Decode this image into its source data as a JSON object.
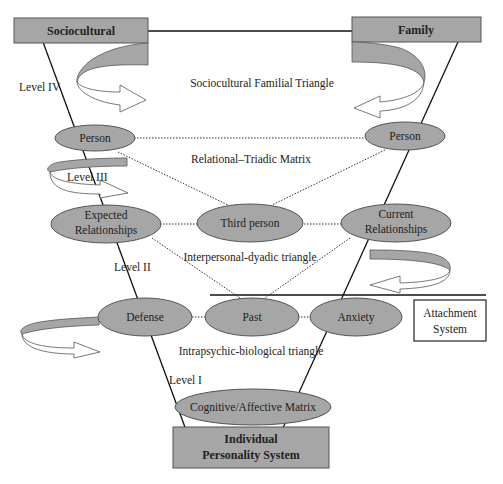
{
  "diagram": {
    "top_boxes": {
      "left": "Sociocultural",
      "right": "Family"
    },
    "bottom_box": {
      "line1": "Individual",
      "line2": "Personality System"
    },
    "side_box": {
      "line1": "Attachment",
      "line2": "System"
    },
    "levels": {
      "level4": "Level IV",
      "level3": "Level III",
      "level2": "Level II",
      "level1": "Level I"
    },
    "triangle_labels": {
      "sociocultural_familial": "Sociocultural Familial Triangle",
      "relational_triadic": "Relational–Triadic Matrix",
      "interpersonal_dyadic": "Interpersonal-dyadic triangle",
      "intrapsychic_biological": "Intrapsychic-biological triangle"
    },
    "nodes": {
      "person_left": "Person",
      "person_right": "Person",
      "expected_line1": "Expected",
      "expected_line2": "Relationships",
      "third_person": "Third person",
      "current_line1": "Current",
      "current_line2": "Relationships",
      "defense": "Defense",
      "past": "Past",
      "anxiety": "Anxiety",
      "cognitive_affective": "Cognitive/Affective Matrix"
    },
    "colors": {
      "node_fill": "#a6a6a6",
      "stroke": "#555555",
      "background": "#ffffff"
    }
  }
}
